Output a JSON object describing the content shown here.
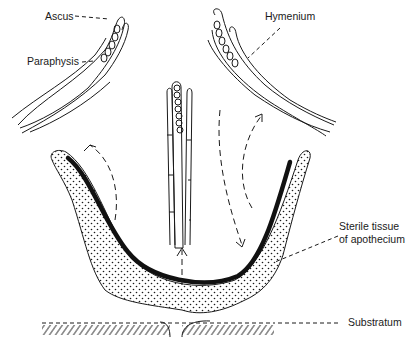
{
  "diagram": {
    "labels": {
      "ascus": "Ascus",
      "paraphysis": "Paraphysis",
      "hymenium": "Hymenium",
      "sterile_tissue_line1": "Sterile tissue",
      "sterile_tissue_line2": "of apothecium",
      "substratum": "Substratum"
    },
    "colors": {
      "ink": "#1a1a1a",
      "background": "#ffffff",
      "hymenium_layer": "#111111"
    },
    "parts": [
      "left-hymenium-fragment",
      "center-hymenium-fragment",
      "right-hymenium-fragment",
      "apothecium-cup",
      "hymenium-layer",
      "substratum-hatching"
    ]
  }
}
